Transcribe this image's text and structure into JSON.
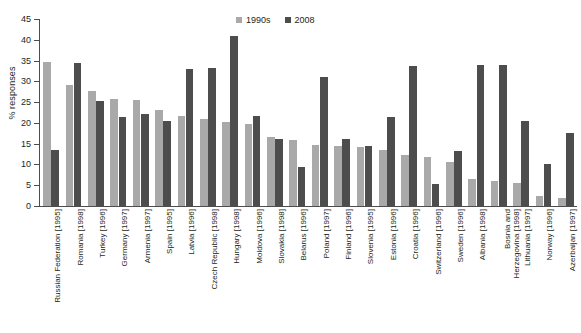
{
  "chart_data": {
    "type": "bar",
    "title": "",
    "xlabel": "",
    "ylabel": "% responses",
    "ylim": [
      0,
      45
    ],
    "yticks": [
      0,
      5,
      10,
      15,
      20,
      25,
      30,
      35,
      40,
      45
    ],
    "grid": false,
    "legend_position": "top-center",
    "colors": {
      "1990s": "#a9a9a9",
      "2008": "#4d4d4d"
    },
    "categories": [
      "Russian Federation [1995]",
      "Romania [1998]",
      "Turkey [1996]",
      "Germany [1997]",
      "Armenia [1997]",
      "Spain [1995]",
      "Latvia [1996]",
      "Czech Republic [1998]",
      "Hungary [1998]",
      "Moldova [1996]",
      "Slovakia [1998]",
      "Belarus [1996]",
      "Poland [1997]",
      "Finland [1996]",
      "Slovenia [1995]",
      "Estonia [1996]",
      "Croatia [1996]",
      "Switzerland [1996]",
      "Sweden [1996]",
      "Albania [1998]",
      "Bosnia and\nHerzegovina [1998]",
      "Lithuania [1997]",
      "Norway [1996]",
      "Azerbaijan [1997]"
    ],
    "series": [
      {
        "name": "1990s",
        "color": "#a9a9a9",
        "values": [
          34.6,
          29.2,
          27.6,
          25.7,
          25.6,
          23.2,
          21.6,
          21.0,
          20.3,
          19.8,
          16.6,
          15.8,
          14.8,
          14.5,
          14.3,
          13.4,
          12.3,
          11.9,
          10.6,
          6.5,
          6.0,
          5.5,
          2.5,
          2.0
        ]
      },
      {
        "name": "2008",
        "color": "#4d4d4d",
        "values": [
          13.4,
          34.5,
          25.3,
          21.4,
          22.1,
          20.4,
          33.0,
          33.2,
          41.0,
          21.6,
          16.1,
          9.3,
          31.0,
          16.2,
          14.5,
          21.4,
          33.6,
          5.3,
          13.2,
          33.9,
          33.9,
          20.4,
          10.0,
          17.5
        ]
      }
    ]
  },
  "legend": {
    "items": [
      {
        "label": "1990s",
        "swatch": "square-swatch-light"
      },
      {
        "label": "2008",
        "swatch": "square-swatch-dark"
      }
    ]
  }
}
